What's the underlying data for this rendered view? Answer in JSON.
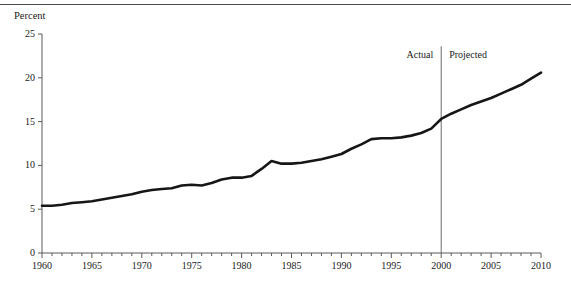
{
  "figure": {
    "top_rule": true,
    "y_axis_title": "Percent",
    "line_color": "#161616",
    "axis_color": "#5a5a5a",
    "divider_color": "#6a6a6a"
  },
  "annotations": [
    {
      "name": "actual",
      "label": "Actual",
      "x_year": 1995.8,
      "y_value": 22.6
    },
    {
      "name": "projected",
      "label": "Projected",
      "x_year": 2000.9,
      "y_value": 22.6
    }
  ],
  "divider": {
    "name": "actual-projected-divider",
    "x_year": 2000,
    "y_top": 23.6,
    "y_bottom": 0
  },
  "chart_data": {
    "type": "line",
    "title": "",
    "subtitle": "",
    "xlabel": "",
    "ylabel": "Percent",
    "xlim": [
      1960,
      2010
    ],
    "ylim": [
      0,
      25
    ],
    "ytick_values": [
      0,
      5,
      10,
      15,
      20,
      25
    ],
    "ytick_labels": [
      "0",
      "5",
      "10",
      "15",
      "20",
      "25"
    ],
    "xtick_values": [
      1960,
      1965,
      1970,
      1975,
      1980,
      1985,
      1990,
      1995,
      2000,
      2005,
      2010
    ],
    "xtick_labels": [
      "1960",
      "1965",
      "1970",
      "1975",
      "1980",
      "1985",
      "1990",
      "1995",
      "2000",
      "2005",
      "2010"
    ],
    "x_minor_tick_interval": 1,
    "grid": false,
    "legend": null,
    "series": [
      {
        "name": "Percent",
        "x": [
          1960,
          1961,
          1962,
          1963,
          1964,
          1965,
          1966,
          1967,
          1968,
          1969,
          1970,
          1971,
          1972,
          1973,
          1974,
          1975,
          1976,
          1977,
          1978,
          1979,
          1980,
          1981,
          1982,
          1983,
          1984,
          1985,
          1986,
          1987,
          1988,
          1989,
          1990,
          1991,
          1992,
          1993,
          1994,
          1995,
          1996,
          1997,
          1998,
          1999,
          2000,
          2001,
          2002,
          2003,
          2004,
          2005,
          2006,
          2007,
          2008,
          2009,
          2010
        ],
        "values": [
          5.4,
          5.4,
          5.5,
          5.7,
          5.8,
          5.9,
          6.1,
          6.3,
          6.5,
          6.7,
          7.0,
          7.2,
          7.3,
          7.4,
          7.7,
          7.8,
          7.7,
          8.0,
          8.4,
          8.6,
          8.6,
          8.8,
          9.6,
          10.5,
          10.2,
          10.2,
          10.3,
          10.5,
          10.7,
          11.0,
          11.3,
          11.9,
          12.4,
          13.0,
          13.1,
          13.1,
          13.2,
          13.4,
          13.7,
          14.2,
          15.3,
          15.9,
          16.4,
          16.9,
          17.3,
          17.7,
          18.2,
          18.7,
          19.2,
          19.9,
          20.6
        ]
      }
    ],
    "annotations": [
      {
        "text": "Actual",
        "x": 1995.8,
        "y": 22.6
      },
      {
        "text": "Projected",
        "x": 2000.9,
        "y": 22.6
      }
    ],
    "vertical_reference_line": {
      "x": 2000,
      "label_left": "Actual",
      "label_right": "Projected"
    }
  }
}
